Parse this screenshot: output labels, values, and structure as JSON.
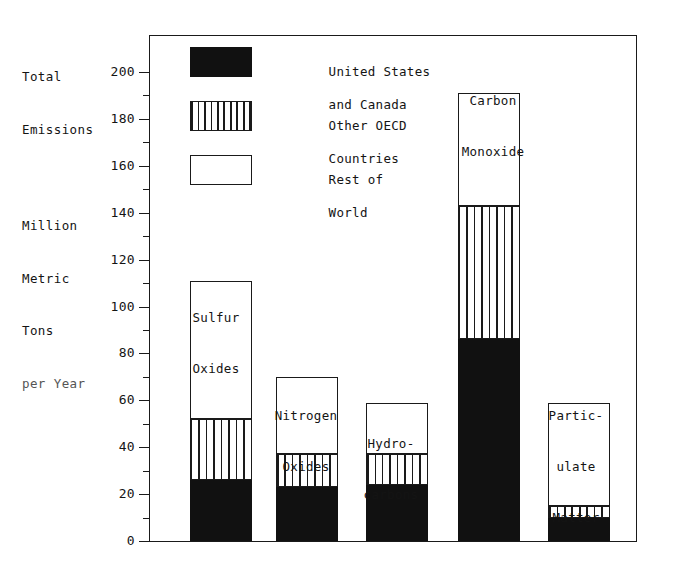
{
  "chart_data": {
    "type": "bar",
    "subtype": "stacked-bar",
    "title": "",
    "axis_title_lines": [
      "Total",
      "Emissions",
      "",
      "Million",
      "Metric",
      "Tons",
      "per Year"
    ],
    "ylabel": "Total Emissions Million Metric Tons per Year",
    "xlabel": "",
    "ylim": [
      0,
      200
    ],
    "ytick_step": 20,
    "yminor_step": 10,
    "grid": false,
    "legend_position": "inside-top-left",
    "categories": [
      "Sulfur Oxides",
      "Nitrogen Oxides",
      "Hydrocarbons",
      "Carbon Monoxide",
      "Particulate Matter"
    ],
    "category_label_lines": [
      [
        "Sulfur",
        "Oxides"
      ],
      [
        "Nitrogen",
        "Oxides"
      ],
      [
        "Hydro-",
        "carbons"
      ],
      [
        "Carbon",
        "Monoxide"
      ],
      [
        "Partic-",
        "ulate",
        "Matter"
      ]
    ],
    "yticks": [
      {
        "value": 200,
        "label": "200"
      },
      {
        "value": 180,
        "label": "180"
      },
      {
        "value": 160,
        "label": "160"
      },
      {
        "value": 140,
        "label": "140"
      },
      {
        "value": 120,
        "label": "120"
      },
      {
        "value": 100,
        "label": "100"
      },
      {
        "value": 80,
        "label": "80"
      },
      {
        "value": 60,
        "label": "60"
      },
      {
        "value": 40,
        "label": "40"
      },
      {
        "value": 20,
        "label": "20"
      },
      {
        "value": 0,
        "label": "0"
      }
    ],
    "yminor_ticks": [
      190,
      170,
      150,
      130,
      110,
      90,
      70,
      50,
      30,
      10
    ],
    "series": [
      {
        "name": "United States and Canada",
        "fill": "solid-black",
        "values": [
          26,
          23,
          24,
          86,
          10
        ]
      },
      {
        "name": "Other OECD Countries",
        "fill": "vertical-hatch",
        "values": [
          26,
          14,
          13,
          57,
          5
        ]
      },
      {
        "name": "Rest of World",
        "fill": "white",
        "values": [
          59,
          33,
          22,
          48,
          44
        ]
      }
    ],
    "cumulative_tops": {
      "us_canada": [
        26,
        23,
        24,
        86,
        10
      ],
      "other_oecd": [
        52,
        37,
        37,
        143,
        15
      ],
      "total": [
        111,
        70,
        59,
        191,
        59
      ]
    },
    "totals": [
      111,
      70,
      59,
      191,
      59
    ]
  },
  "legend": {
    "entries": [
      {
        "swatch": "black",
        "lines": [
          "United States",
          "and Canada"
        ]
      },
      {
        "swatch": "hatch",
        "lines": [
          "Other OECD",
          "Countries"
        ]
      },
      {
        "swatch": "white",
        "lines": [
          "Rest of",
          "World"
        ]
      }
    ]
  },
  "labels": {
    "axis_title_l1": "Total",
    "axis_title_l2": "Emissions",
    "axis_title_l3": "Million",
    "axis_title_l4": "Metric",
    "axis_title_l5": "Tons",
    "axis_title_l6": "per Year",
    "legend_1_l1": "United States",
    "legend_1_l2": "and Canada",
    "legend_2_l1": "Other OECD",
    "legend_2_l2": "Countries",
    "legend_3_l1": "Rest of",
    "legend_3_l2": "World",
    "cat_1_l1": "Sulfur",
    "cat_1_l2": "Oxides",
    "cat_2_l1": "Nitrogen",
    "cat_2_l2": "Oxides",
    "cat_3_l1": "Hydro-",
    "cat_3_l2": "carbons",
    "cat_4_l1": "Carbon",
    "cat_4_l2": "Monoxide",
    "cat_5_l1": "Partic-",
    "cat_5_l2": "ulate",
    "cat_5_l3": "Matter"
  },
  "colors": {
    "ink": "#1a1a1a",
    "solid_fill": "#111111",
    "background": "#ffffff"
  }
}
